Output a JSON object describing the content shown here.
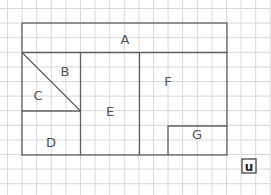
{
  "diagram": {
    "type": "grid-area-puzzle",
    "grid": {
      "cell_size_px": 14.6,
      "origin": [
        7.5,
        8.5
      ],
      "columns": 18,
      "rows": 12,
      "line_color": "#d8d8d8"
    },
    "outline_color": "#606060",
    "regions": [
      {
        "id": "A",
        "label": "A",
        "label_pos": [
          125,
          40
        ]
      },
      {
        "id": "B",
        "label": "B",
        "label_pos": [
          65,
          72
        ]
      },
      {
        "id": "C",
        "label": "C",
        "label_pos": [
          38,
          96
        ]
      },
      {
        "id": "D",
        "label": "D",
        "label_pos": [
          51,
          143
        ]
      },
      {
        "id": "E",
        "label": "E",
        "label_pos": [
          110,
          112
        ]
      },
      {
        "id": "F",
        "label": "F",
        "label_pos": [
          168,
          82
        ]
      },
      {
        "id": "G",
        "label": "G",
        "label_pos": [
          197,
          135
        ]
      }
    ],
    "unit_box": {
      "label": "u",
      "x": 242,
      "y": 159,
      "size": 14
    }
  }
}
